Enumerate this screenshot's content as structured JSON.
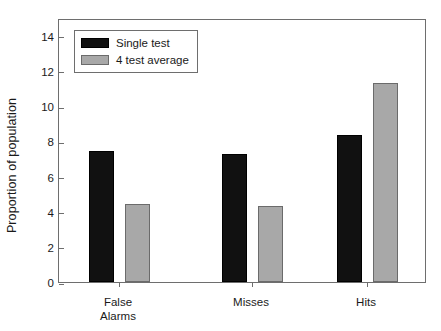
{
  "chart_data": {
    "type": "bar",
    "title": "",
    "xlabel": "",
    "ylabel": "Proportion of population",
    "categories": [
      "False\nAlarms",
      "Misses",
      "Hits"
    ],
    "category_lines": [
      [
        "False",
        "Alarms"
      ],
      [
        "Misses"
      ],
      [
        "Hits"
      ]
    ],
    "series": [
      {
        "name": "Single test",
        "color": "#111111",
        "values": [
          7.45,
          7.25,
          8.35
        ]
      },
      {
        "name": "4 test average",
        "color": "#a8a8a8",
        "values": [
          4.45,
          4.3,
          11.3
        ]
      }
    ],
    "ylim": [
      0,
      15
    ],
    "yticks": [
      0,
      2,
      4,
      6,
      8,
      10,
      12,
      14
    ],
    "ytick_labels": [
      "0",
      "2",
      "4",
      "6",
      "8",
      "10",
      "12",
      "14"
    ],
    "grid": false,
    "legend_position": "upper-left",
    "axis_color": "#6e6e6e"
  }
}
